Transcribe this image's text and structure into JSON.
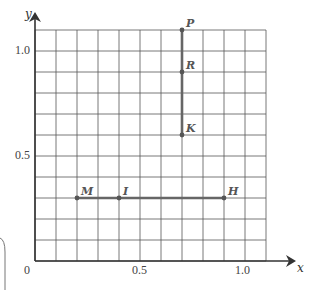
{
  "axes": {
    "x_label": "x",
    "y_label": "y",
    "origin_label": "0",
    "x_ticks": [
      {
        "value": 0.5,
        "label": "0.5"
      },
      {
        "value": 1.0,
        "label": "1.0"
      }
    ],
    "y_ticks": [
      {
        "value": 0.5,
        "label": "0.5"
      },
      {
        "value": 1.0,
        "label": "1.0"
      }
    ],
    "grid_step": 0.1,
    "x_range": [
      0,
      1.1
    ],
    "y_range": [
      0,
      1.1
    ]
  },
  "points": [
    {
      "name": "P",
      "x": 0.7,
      "y": 1.1
    },
    {
      "name": "R",
      "x": 0.7,
      "y": 0.9
    },
    {
      "name": "K",
      "x": 0.7,
      "y": 0.6
    },
    {
      "name": "M",
      "x": 0.2,
      "y": 0.3
    },
    {
      "name": "I",
      "x": 0.4,
      "y": 0.3
    },
    {
      "name": "H",
      "x": 0.9,
      "y": 0.3
    }
  ],
  "segments": [
    {
      "from": "P",
      "to": "K"
    },
    {
      "from": "M",
      "to": "H"
    }
  ],
  "colors": {
    "grid": "#555555",
    "segment": "#666666",
    "axis": "#333333"
  }
}
